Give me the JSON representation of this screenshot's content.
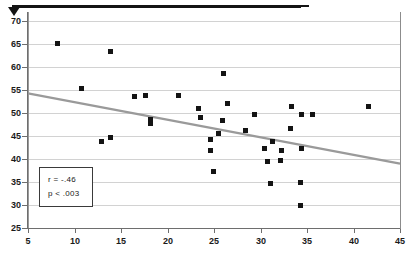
{
  "chart_data": {
    "type": "scatter",
    "title": "",
    "subtitle": "",
    "xlabel": "",
    "ylabel": "",
    "xlim": [
      5,
      45
    ],
    "ylim": [
      25,
      72
    ],
    "xticks": [
      5,
      10,
      15,
      20,
      25,
      30,
      35,
      40,
      45
    ],
    "yticks": [
      25,
      30,
      35,
      40,
      45,
      50,
      55,
      60,
      65,
      70
    ],
    "grid": "horizontal",
    "legend": "none",
    "marker": "filled-square",
    "marker_color": "#141414",
    "trendline": {
      "type": "linear-fit",
      "color": "#9a9a9a",
      "x_start": 5,
      "y_start": 54.3,
      "x_end": 45,
      "y_end": 39.0
    },
    "annotations": {
      "stats_box": {
        "correlation_label": "r = -.46",
        "pvalue_label": "p < .003"
      }
    },
    "points": [
      {
        "x": 8.2,
        "y": 65.1
      },
      {
        "x": 13.9,
        "y": 63.4
      },
      {
        "x": 10.8,
        "y": 55.4
      },
      {
        "x": 16.4,
        "y": 53.6
      },
      {
        "x": 17.6,
        "y": 53.9
      },
      {
        "x": 21.2,
        "y": 53.8
      },
      {
        "x": 26.0,
        "y": 58.7
      },
      {
        "x": 26.5,
        "y": 52.1
      },
      {
        "x": 23.3,
        "y": 51.0
      },
      {
        "x": 23.6,
        "y": 49.0
      },
      {
        "x": 33.3,
        "y": 51.4
      },
      {
        "x": 34.4,
        "y": 49.8
      },
      {
        "x": 35.6,
        "y": 49.8
      },
      {
        "x": 41.6,
        "y": 51.4
      },
      {
        "x": 29.4,
        "y": 49.8
      },
      {
        "x": 25.9,
        "y": 48.5
      },
      {
        "x": 18.2,
        "y": 48.7
      },
      {
        "x": 18.2,
        "y": 47.7
      },
      {
        "x": 33.2,
        "y": 46.6
      },
      {
        "x": 28.4,
        "y": 46.3
      },
      {
        "x": 25.5,
        "y": 45.5
      },
      {
        "x": 24.6,
        "y": 44.3
      },
      {
        "x": 31.3,
        "y": 43.8
      },
      {
        "x": 12.9,
        "y": 43.9
      },
      {
        "x": 13.9,
        "y": 44.7
      },
      {
        "x": 30.4,
        "y": 42.4
      },
      {
        "x": 34.4,
        "y": 42.2
      },
      {
        "x": 32.3,
        "y": 41.8
      },
      {
        "x": 24.6,
        "y": 41.9
      },
      {
        "x": 32.2,
        "y": 39.7
      },
      {
        "x": 30.8,
        "y": 39.5
      },
      {
        "x": 24.9,
        "y": 37.3
      },
      {
        "x": 31.1,
        "y": 34.7
      },
      {
        "x": 34.3,
        "y": 34.8
      },
      {
        "x": 34.3,
        "y": 29.8
      }
    ]
  }
}
